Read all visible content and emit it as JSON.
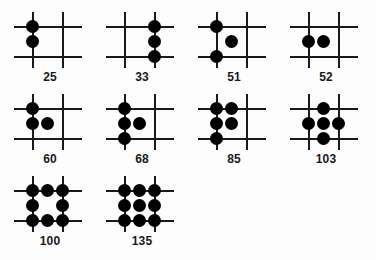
{
  "figure": {
    "background_color": "#fdfdfd",
    "line_color": "#1a1a1a",
    "dot_color": "#000000",
    "lattice": {
      "columns": 3,
      "rows": 3,
      "description": "3x3 lattice formed by two vertical and two horizontal grid lines plus their midpoints"
    },
    "panels": [
      {
        "label": "25",
        "dot_count": 2,
        "dots": [
          {
            "col": 0,
            "row": 0
          },
          {
            "col": 0,
            "row": 1
          }
        ]
      },
      {
        "label": "33",
        "dot_count": 3,
        "dots": [
          {
            "col": 2,
            "row": 0
          },
          {
            "col": 2,
            "row": 1
          },
          {
            "col": 2,
            "row": 2
          }
        ]
      },
      {
        "label": "51",
        "dot_count": 3,
        "dots": [
          {
            "col": 0,
            "row": 0
          },
          {
            "col": 1,
            "row": 1
          },
          {
            "col": 0,
            "row": 2
          }
        ]
      },
      {
        "label": "52",
        "dot_count": 2,
        "dots": [
          {
            "col": 0,
            "row": 1
          },
          {
            "col": 1,
            "row": 1
          }
        ]
      },
      {
        "label": "60",
        "dot_count": 3,
        "dots": [
          {
            "col": 0,
            "row": 0
          },
          {
            "col": 0,
            "row": 1
          },
          {
            "col": 1,
            "row": 1
          }
        ]
      },
      {
        "label": "68",
        "dot_count": 4,
        "dots": [
          {
            "col": 0,
            "row": 0
          },
          {
            "col": 0,
            "row": 1
          },
          {
            "col": 1,
            "row": 1
          },
          {
            "col": 0,
            "row": 2
          }
        ]
      },
      {
        "label": "85",
        "dot_count": 5,
        "dots": [
          {
            "col": 0,
            "row": 0
          },
          {
            "col": 1,
            "row": 0
          },
          {
            "col": 0,
            "row": 1
          },
          {
            "col": 1,
            "row": 1
          },
          {
            "col": 0,
            "row": 2
          }
        ]
      },
      {
        "label": "103",
        "dot_count": 5,
        "dots": [
          {
            "col": 1,
            "row": 0
          },
          {
            "col": 0,
            "row": 1
          },
          {
            "col": 1,
            "row": 1
          },
          {
            "col": 2,
            "row": 1
          },
          {
            "col": 1,
            "row": 2
          }
        ]
      },
      {
        "label": "100",
        "dot_count": 8,
        "dots": [
          {
            "col": 0,
            "row": 0
          },
          {
            "col": 1,
            "row": 0
          },
          {
            "col": 2,
            "row": 0
          },
          {
            "col": 0,
            "row": 1
          },
          {
            "col": 2,
            "row": 1
          },
          {
            "col": 0,
            "row": 2
          },
          {
            "col": 1,
            "row": 2
          },
          {
            "col": 2,
            "row": 2
          }
        ]
      },
      {
        "label": "135",
        "dot_count": 9,
        "dots": [
          {
            "col": 0,
            "row": 0
          },
          {
            "col": 1,
            "row": 0
          },
          {
            "col": 2,
            "row": 0
          },
          {
            "col": 0,
            "row": 1
          },
          {
            "col": 1,
            "row": 1
          },
          {
            "col": 2,
            "row": 1
          },
          {
            "col": 0,
            "row": 2
          },
          {
            "col": 1,
            "row": 2
          },
          {
            "col": 2,
            "row": 2
          }
        ]
      }
    ]
  }
}
